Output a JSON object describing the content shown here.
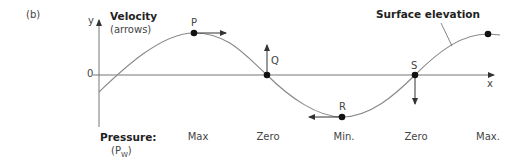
{
  "panel_label": "(b)",
  "axes": {
    "y_label": "y",
    "x_label": "x",
    "zero_label": "0"
  },
  "velocity": {
    "title": "Velocity",
    "subtitle": "(arrows)"
  },
  "surface_label": "Surface elevation",
  "points": [
    {
      "id": "P",
      "label": "P",
      "arrow": "right"
    },
    {
      "id": "Q",
      "label": "Q",
      "arrow": "up"
    },
    {
      "id": "R",
      "label": "R",
      "arrow": "left"
    },
    {
      "id": "S",
      "label": "S",
      "arrow": "down"
    }
  ],
  "pressure": {
    "title": "Pressure:",
    "symbol": "(P",
    "subscript": "W",
    "close": ")",
    "values": [
      "Max",
      "Zero",
      "Min.",
      "Zero",
      "Max."
    ]
  },
  "colors": {
    "curve": "#888888",
    "axis": "#777777",
    "dot": "#111111",
    "arrow": "#333333"
  }
}
